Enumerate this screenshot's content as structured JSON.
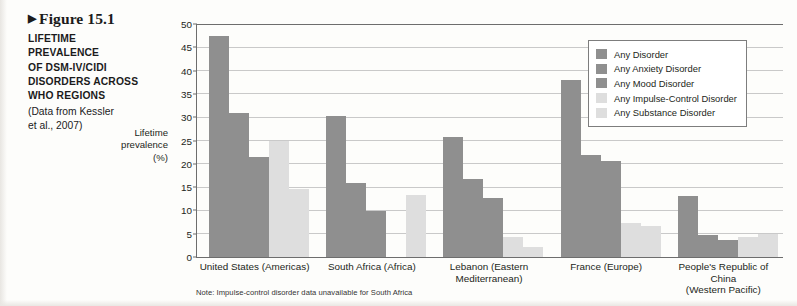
{
  "figure": {
    "marker": "▶",
    "number": "Figure 15.1",
    "source": "(Data from Kessler\net al., 2007)"
  },
  "legend": {
    "position": "top-right",
    "items": [
      {
        "label": "Any Disorder",
        "color": "#8f8f8f",
        "swatch": "c-dark"
      },
      {
        "label": "Any Anxiety Disorder",
        "color": "#8f8f8f",
        "swatch": "c-dark"
      },
      {
        "label": "Any Mood Disorder",
        "color": "#8f8f8f",
        "swatch": "c-dark"
      },
      {
        "label": "Any Impulse-Control Disorder",
        "color": "#dedede",
        "swatch": "c-light"
      },
      {
        "label": "Any Substance Disorder",
        "color": "#dedede",
        "swatch": "c-light"
      }
    ]
  },
  "axis": {
    "y_title_line1": "Lifetime",
    "y_title_line2": "prevalence",
    "y_title_line3": "(%)",
    "yticks": [
      0,
      5,
      10,
      15,
      20,
      25,
      30,
      35,
      40,
      45,
      50
    ]
  },
  "footnote": "Note: Impulse-control disorder data unavailable for South Africa",
  "chart_data": {
    "type": "bar",
    "xlabel": "",
    "ylabel": "Lifetime prevalence (%)",
    "ylim": [
      0,
      50
    ],
    "ytick_step": 5,
    "grid": true,
    "legend_position": "top-right",
    "categories": [
      "United States (Americas)",
      "South Africa (Africa)",
      "Lebanon (Eastern\nMediterranean)",
      "France (Europe)",
      "People's Republic of China\n(Western Pacific)"
    ],
    "series": [
      {
        "name": "Any Disorder",
        "color": "#8f8f8f",
        "values": [
          47.4,
          30.3,
          25.8,
          37.9,
          13.2
        ]
      },
      {
        "name": "Any Anxiety Disorder",
        "color": "#8f8f8f",
        "values": [
          31.0,
          15.8,
          16.7,
          21.9,
          4.8
        ]
      },
      {
        "name": "Any Mood Disorder",
        "color": "#8f8f8f",
        "values": [
          21.4,
          9.8,
          12.6,
          20.6,
          3.6
        ]
      },
      {
        "name": "Any Impulse-Control Disorder",
        "color": "#dedede",
        "values": [
          25.0,
          null,
          4.4,
          7.2,
          4.3
        ]
      },
      {
        "name": "Any Substance Disorder",
        "color": "#dedede",
        "values": [
          14.6,
          13.3,
          2.2,
          6.7,
          4.9
        ]
      }
    ],
    "notes": "Impulse-control disorder data unavailable for South Africa"
  }
}
